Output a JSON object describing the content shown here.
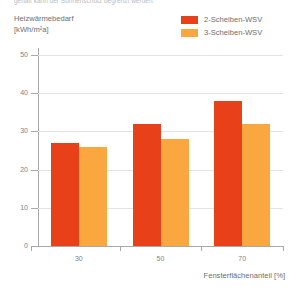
{
  "caption": {
    "cutoff_line": "gehalt kann der Sonnenschutz begrenzt werden."
  },
  "chart_data": {
    "type": "bar",
    "title": "",
    "categories": [
      "30",
      "50",
      "70"
    ],
    "series": [
      {
        "name": "2-Scheiben-WSV",
        "color": "#E8411A",
        "values": [
          27,
          32,
          38
        ]
      },
      {
        "name": "3-Scheiben-WSV",
        "color": "#F9A73E",
        "values": [
          26,
          28,
          32
        ]
      }
    ],
    "ylabel_line1": "Heizwärmebedarf",
    "ylabel_line2": "[kWh/m²a]",
    "xlabel": "Fensterflächenanteil [%]",
    "ylim": [
      0,
      50
    ],
    "yticks": [
      0,
      10,
      20,
      30,
      40,
      50
    ],
    "ytick_labels": [
      "0",
      "10",
      "20",
      "30",
      "40",
      "50"
    ],
    "grid": true,
    "legend_position": "top-right"
  },
  "colors": {
    "series_1": "#E8411A",
    "series_2": "#F9A73E",
    "gridline": "#e3e4e5",
    "axis": "#a7a9ac",
    "text": "#6d6e71"
  }
}
